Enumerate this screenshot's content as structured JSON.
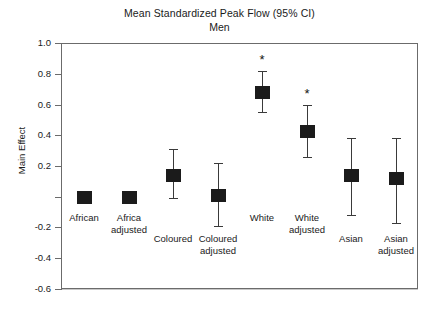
{
  "chart_data": {
    "type": "scatter",
    "title": "Mean Standardized Peak Flow (95% CI)",
    "subtitle": "Men",
    "xlabel": "",
    "ylabel": "Main Effect",
    "ylim": [
      -0.6,
      1.0
    ],
    "ytick_labels": [
      "1.0",
      "0.8",
      "0.6",
      "0.4",
      "0.2",
      "",
      "-0.2",
      "-0.4",
      "-0.6"
    ],
    "ytick_values": [
      1.0,
      0.8,
      0.6,
      0.4,
      0.2,
      0.0,
      -0.2,
      -0.4,
      -0.6
    ],
    "grid": true,
    "legend": "none",
    "reference_line": 0.0,
    "categories": [
      "African",
      "Africa adjusted",
      "Coloured",
      "Coloured adjusted",
      "White",
      "White adjusted",
      "Asian",
      "Asian adjusted"
    ],
    "values": [
      0.0,
      0.0,
      0.14,
      0.01,
      0.68,
      0.43,
      0.14,
      0.12
    ],
    "ci_lower": [
      0.0,
      0.0,
      -0.01,
      -0.19,
      0.55,
      0.26,
      -0.12,
      -0.17
    ],
    "ci_upper": [
      0.0,
      0.0,
      0.31,
      0.22,
      0.82,
      0.6,
      0.38,
      0.38
    ],
    "significance": [
      "",
      "",
      "",
      "",
      "*",
      "*",
      "",
      ""
    ],
    "significance_marker": "*",
    "marker_color": "#1b1b1b",
    "line_color": "#3a3a3a",
    "grid_color": "#c9c9c9",
    "axis_color": "#6b6b6b",
    "zero_line_color": "#111111"
  },
  "category_labels": [
    {
      "line1": "African",
      "line2": "",
      "row": "upper"
    },
    {
      "line1": "Africa",
      "line2": "adjusted",
      "row": "upper"
    },
    {
      "line1": "Coloured",
      "line2": "",
      "row": "lower"
    },
    {
      "line1": "Coloured",
      "line2": "adjusted",
      "row": "lower"
    },
    {
      "line1": "White",
      "line2": "",
      "row": "upper"
    },
    {
      "line1": "White",
      "line2": "adjusted",
      "row": "upper"
    },
    {
      "line1": "Asian",
      "line2": "",
      "row": "lower"
    },
    {
      "line1": "Asian",
      "line2": "adjusted",
      "row": "lower"
    }
  ]
}
